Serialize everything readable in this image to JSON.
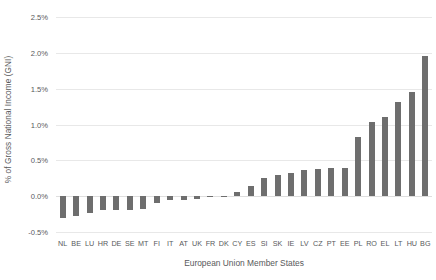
{
  "chart_data": {
    "type": "bar",
    "title": "",
    "subtitle": "",
    "xlabel": "European Union Member States",
    "ylabel": "% of Gross National Income (GNI)",
    "ylim": [
      -0.5,
      2.5
    ],
    "ytick_labels": [
      "2.5%",
      "2.0%",
      "1.5%",
      "1.0%",
      "0.5%",
      "0.0%",
      "-0.5%"
    ],
    "ytick_values": [
      2.5,
      2.0,
      1.5,
      1.0,
      0.5,
      0.0,
      -0.5
    ],
    "grid": true,
    "legend": "none",
    "value_suffix": "%",
    "bar_color": "#6e6e6e",
    "gridline_color": "#e8e8e8",
    "text_color": "#58595b",
    "categories": [
      "NL",
      "BE",
      "LU",
      "HR",
      "DE",
      "SE",
      "MT",
      "FI",
      "IT",
      "AT",
      "UK",
      "FR",
      "DK",
      "CY",
      "ES",
      "SI",
      "SK",
      "IE",
      "LV",
      "CZ",
      "PT",
      "EE",
      "PL",
      "RO",
      "EL",
      "LT",
      "HU",
      "BG"
    ],
    "values": [
      -0.31,
      -0.27,
      -0.23,
      -0.19,
      -0.19,
      -0.19,
      -0.18,
      -0.09,
      -0.06,
      -0.05,
      -0.04,
      -0.01,
      -0.01,
      0.06,
      0.14,
      0.26,
      0.3,
      0.33,
      0.37,
      0.38,
      0.4,
      0.4,
      0.82,
      1.03,
      1.1,
      1.31,
      1.45,
      1.95
    ]
  }
}
